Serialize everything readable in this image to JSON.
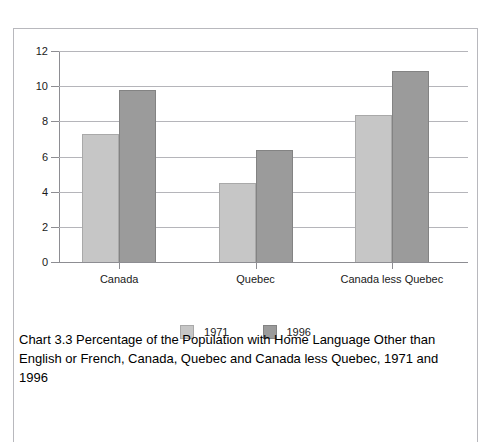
{
  "page_header": "",
  "chart_data": {
    "type": "bar",
    "title": "",
    "caption": "Chart 3.3 Percentage of the Population with Home Language Other than English or French, Canada, Quebec and Canada less Quebec, 1971 and 1996",
    "categories": [
      "Canada",
      "Quebec",
      "Canada less Quebec"
    ],
    "series": [
      {
        "name": "1971",
        "values": [
          7.3,
          4.5,
          8.35
        ],
        "color": "#c6c6c6"
      },
      {
        "name": "1996",
        "values": [
          9.8,
          6.35,
          10.85
        ],
        "color": "#9b9b9b"
      }
    ],
    "xlabel": "",
    "ylabel": "",
    "ylim": [
      0,
      12
    ],
    "yticks": [
      0,
      2,
      4,
      6,
      8,
      10,
      12
    ],
    "ytick_labels": [
      "0",
      "2",
      "4",
      "6",
      "8",
      "10",
      "12"
    ],
    "grid": true,
    "legend_position": "bottom"
  }
}
